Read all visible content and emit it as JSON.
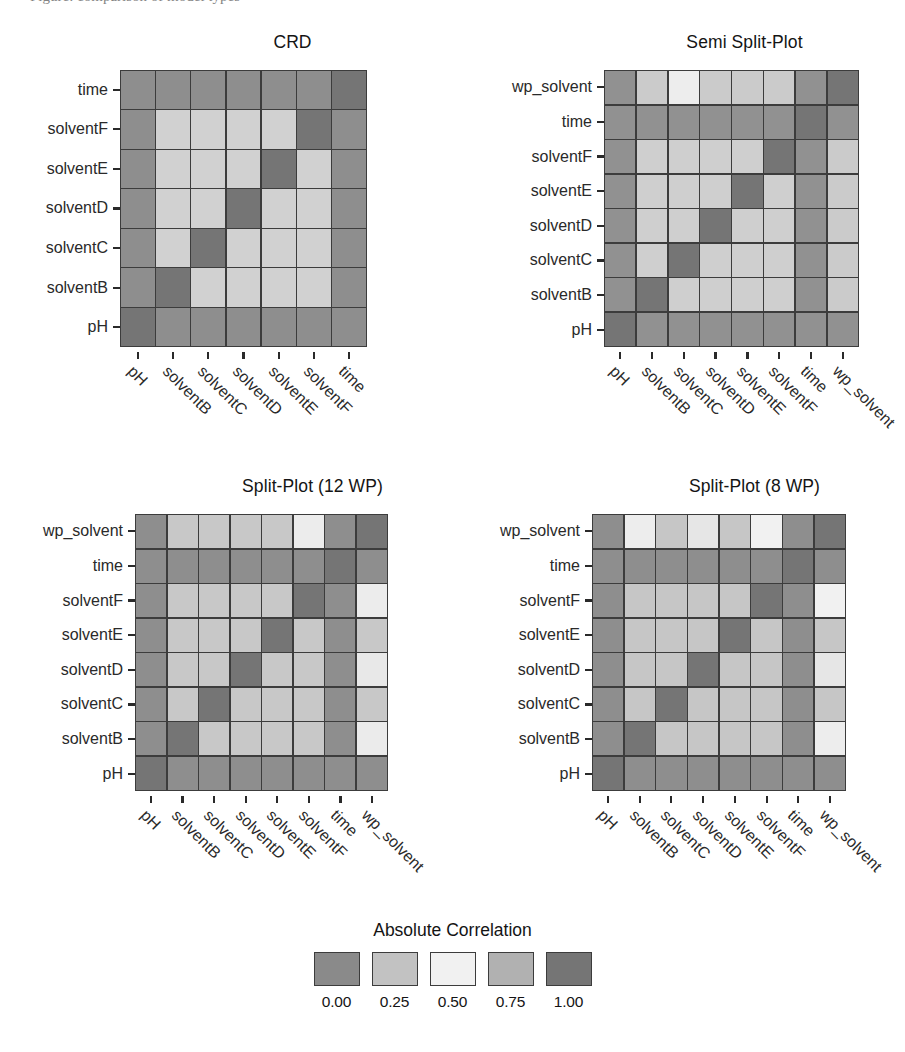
{
  "page": {
    "cropped_header_text": "Figure: comparison of model types"
  },
  "legend": {
    "title": "Absolute Correlation",
    "ticks": [
      "0.00",
      "0.25",
      "0.50",
      "0.75",
      "1.00"
    ],
    "swatch_colors": [
      "#8a8a8a",
      "#c2c2c2",
      "#f1f1f1",
      "#b1b1b1",
      "#757575"
    ]
  },
  "colors": {
    "v000": "#8a8a8a",
    "v025": "#c2c2c2",
    "v050": "#f1f1f1",
    "v075": "#b1b1b1",
    "v100": "#757575",
    "grid_line": "#3c3c3c",
    "text": "#1a1a1a"
  },
  "chart_data": [
    {
      "type": "heatmap",
      "title": "CRD",
      "xlabel": "",
      "ylabel": "",
      "zlabel": "Absolute Correlation",
      "zlim": [
        0.0,
        1.0
      ],
      "grid": true,
      "legend_position": "bottom",
      "x": [
        "pH",
        "solventB",
        "solventC",
        "solventD",
        "solventE",
        "solventF",
        "time"
      ],
      "y": [
        "pH",
        "solventB",
        "solventC",
        "solventD",
        "solventE",
        "solventF",
        "time"
      ],
      "y_display_order": [
        "time",
        "solventF",
        "solventE",
        "solventD",
        "solventC",
        "solventB",
        "pH"
      ],
      "values": [
        [
          1.0,
          0.02,
          0.02,
          0.02,
          0.02,
          0.02,
          0.02
        ],
        [
          0.02,
          1.0,
          0.33,
          0.33,
          0.33,
          0.33,
          0.02
        ],
        [
          0.02,
          0.33,
          1.0,
          0.33,
          0.33,
          0.33,
          0.02
        ],
        [
          0.02,
          0.33,
          0.33,
          1.0,
          0.33,
          0.33,
          0.02
        ],
        [
          0.02,
          0.33,
          0.33,
          0.33,
          1.0,
          0.33,
          0.02
        ],
        [
          0.02,
          0.33,
          0.33,
          0.33,
          0.33,
          1.0,
          0.02
        ],
        [
          0.02,
          0.02,
          0.02,
          0.02,
          0.02,
          0.02,
          1.0
        ]
      ]
    },
    {
      "type": "heatmap",
      "title": "Semi Split-Plot",
      "xlabel": "",
      "ylabel": "",
      "zlabel": "Absolute Correlation",
      "zlim": [
        0.0,
        1.0
      ],
      "grid": true,
      "legend_position": "bottom",
      "x": [
        "pH",
        "solventB",
        "solventC",
        "solventD",
        "solventE",
        "solventF",
        "time",
        "wp_solvent"
      ],
      "y": [
        "pH",
        "solventB",
        "solventC",
        "solventD",
        "solventE",
        "solventF",
        "time",
        "wp_solvent"
      ],
      "y_display_order": [
        "wp_solvent",
        "time",
        "solventF",
        "solventE",
        "solventD",
        "solventC",
        "solventB",
        "pH"
      ],
      "values": [
        [
          1.0,
          0.03,
          0.03,
          0.03,
          0.03,
          0.03,
          0.03,
          0.03
        ],
        [
          0.03,
          1.0,
          0.32,
          0.32,
          0.32,
          0.32,
          0.03,
          0.3
        ],
        [
          0.03,
          0.32,
          1.0,
          0.32,
          0.32,
          0.32,
          0.03,
          0.3
        ],
        [
          0.03,
          0.32,
          0.32,
          1.0,
          0.32,
          0.32,
          0.03,
          0.3
        ],
        [
          0.03,
          0.32,
          0.32,
          0.32,
          1.0,
          0.32,
          0.03,
          0.3
        ],
        [
          0.03,
          0.32,
          0.32,
          0.32,
          0.32,
          1.0,
          0.03,
          0.3
        ],
        [
          0.03,
          0.03,
          0.03,
          0.03,
          0.03,
          0.03,
          1.0,
          0.03
        ],
        [
          0.03,
          0.3,
          0.48,
          0.3,
          0.3,
          0.3,
          0.03,
          1.0
        ]
      ]
    },
    {
      "type": "heatmap",
      "title": "Split-Plot (12 WP)",
      "xlabel": "",
      "ylabel": "",
      "zlabel": "Absolute Correlation",
      "zlim": [
        0.0,
        1.0
      ],
      "grid": true,
      "legend_position": "bottom",
      "x": [
        "pH",
        "solventB",
        "solventC",
        "solventD",
        "solventE",
        "solventF",
        "time",
        "wp_solvent"
      ],
      "y": [
        "pH",
        "solventB",
        "solventC",
        "solventD",
        "solventE",
        "solventF",
        "time",
        "wp_solvent"
      ],
      "y_display_order": [
        "wp_solvent",
        "time",
        "solventF",
        "solventE",
        "solventD",
        "solventC",
        "solventB",
        "pH"
      ],
      "values": [
        [
          1.0,
          0.02,
          0.02,
          0.02,
          0.02,
          0.02,
          0.02,
          0.02
        ],
        [
          0.02,
          1.0,
          0.28,
          0.28,
          0.28,
          0.28,
          0.02,
          0.47
        ],
        [
          0.02,
          0.28,
          1.0,
          0.28,
          0.28,
          0.28,
          0.02,
          0.28
        ],
        [
          0.02,
          0.28,
          0.28,
          1.0,
          0.28,
          0.28,
          0.02,
          0.45
        ],
        [
          0.02,
          0.28,
          0.28,
          0.28,
          1.0,
          0.28,
          0.02,
          0.28
        ],
        [
          0.02,
          0.28,
          0.28,
          0.28,
          0.28,
          1.0,
          0.02,
          0.52
        ],
        [
          0.02,
          0.02,
          0.02,
          0.02,
          0.02,
          0.02,
          1.0,
          0.02
        ],
        [
          0.02,
          0.28,
          0.28,
          0.28,
          0.28,
          0.52,
          0.02,
          1.0
        ]
      ]
    },
    {
      "type": "heatmap",
      "title": "Split-Plot (8 WP)",
      "xlabel": "",
      "ylabel": "",
      "zlabel": "Absolute Correlation",
      "zlim": [
        0.0,
        1.0
      ],
      "grid": true,
      "legend_position": "bottom",
      "x": [
        "pH",
        "solventB",
        "solventC",
        "solventD",
        "solventE",
        "solventF",
        "time",
        "wp_solvent"
      ],
      "y": [
        "pH",
        "solventB",
        "solventC",
        "solventD",
        "solventE",
        "solventF",
        "time",
        "wp_solvent"
      ],
      "y_display_order": [
        "wp_solvent",
        "time",
        "solventF",
        "solventE",
        "solventD",
        "solventC",
        "solventB",
        "pH"
      ],
      "values": [
        [
          1.0,
          0.02,
          0.02,
          0.02,
          0.02,
          0.02,
          0.02,
          0.02
        ],
        [
          0.02,
          1.0,
          0.27,
          0.27,
          0.27,
          0.27,
          0.02,
          0.48
        ],
        [
          0.02,
          0.27,
          1.0,
          0.27,
          0.27,
          0.27,
          0.02,
          0.27
        ],
        [
          0.02,
          0.27,
          0.27,
          1.0,
          0.27,
          0.27,
          0.02,
          0.44
        ],
        [
          0.02,
          0.27,
          0.27,
          0.27,
          1.0,
          0.27,
          0.02,
          0.27
        ],
        [
          0.02,
          0.27,
          0.27,
          0.27,
          0.27,
          1.0,
          0.02,
          0.5
        ],
        [
          0.02,
          0.02,
          0.02,
          0.02,
          0.02,
          0.02,
          1.0,
          0.02
        ],
        [
          0.02,
          0.48,
          0.27,
          0.44,
          0.27,
          0.5,
          0.02,
          1.0
        ]
      ]
    }
  ]
}
